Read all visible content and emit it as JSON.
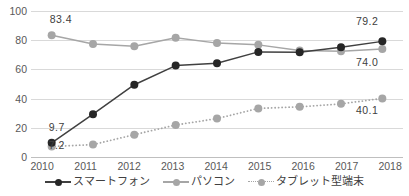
{
  "chart_data": {
    "type": "line",
    "title": "",
    "subtitle": "",
    "xlabel": "",
    "ylabel": "",
    "categories": [
      "2010",
      "2011",
      "2012",
      "2013",
      "2014",
      "2015",
      "2016",
      "2017",
      "2018"
    ],
    "ylim": [
      0,
      100
    ],
    "yticks": [
      0,
      20,
      40,
      60,
      80,
      100
    ],
    "grid": true,
    "legend_position": "bottom",
    "series": [
      {
        "name": "スマートフォン",
        "style": "solid",
        "color": "#404040",
        "marker_color": "#262626",
        "values": [
          9.7,
          29.3,
          49.5,
          62.6,
          64.2,
          72.0,
          71.8,
          75.1,
          79.2
        ]
      },
      {
        "name": "パソコン",
        "style": "solid",
        "color": "#a6a6a6",
        "marker_color": "#a6a6a6",
        "values": [
          83.4,
          77.4,
          75.8,
          81.7,
          78.0,
          76.8,
          73.0,
          72.5,
          74.0
        ]
      },
      {
        "name": "タブレット型端末",
        "style": "dotted",
        "color": "#a6a6a6",
        "marker_color": "#a6a6a6",
        "values": [
          7.2,
          8.5,
          15.3,
          21.9,
          26.3,
          33.3,
          34.4,
          36.4,
          40.1
        ]
      }
    ],
    "annotations": [
      {
        "text": "83.4",
        "series": "パソコン",
        "category": "2010",
        "value": 83.4
      },
      {
        "text": "9.7",
        "series": "スマートフォン",
        "category": "2010",
        "value": 9.7
      },
      {
        "text": "7.2",
        "series": "タブレット型端末",
        "category": "2010",
        "value": 7.2
      },
      {
        "text": "79.2",
        "series": "スマートフォン",
        "category": "2018",
        "value": 79.2
      },
      {
        "text": "74.0",
        "series": "パソコン",
        "category": "2018",
        "value": 74.0
      },
      {
        "text": "40.1",
        "series": "タブレット型端末",
        "category": "2018",
        "value": 40.1
      }
    ]
  },
  "legend": {
    "items": [
      {
        "label": "スマートフォン",
        "key": "solid-dark-marker"
      },
      {
        "label": "パソコン",
        "key": "solid-gray-marker"
      },
      {
        "label": "タブレット型端末",
        "key": "dotted-gray-marker"
      }
    ]
  },
  "axis": {
    "y_tick_labels": [
      "100",
      "80",
      "60",
      "40",
      "20",
      "0"
    ],
    "x_tick_labels": [
      "2010",
      "2011",
      "2012",
      "2013",
      "2014",
      "2015",
      "2016",
      "2017",
      "2018"
    ]
  },
  "annotation_labels": {
    "pc_first": "83.4",
    "smartphone_first": "9.7",
    "tablet_first": "7.2",
    "smartphone_last": "79.2",
    "pc_last": "74.0",
    "tablet_last": "40.1"
  }
}
